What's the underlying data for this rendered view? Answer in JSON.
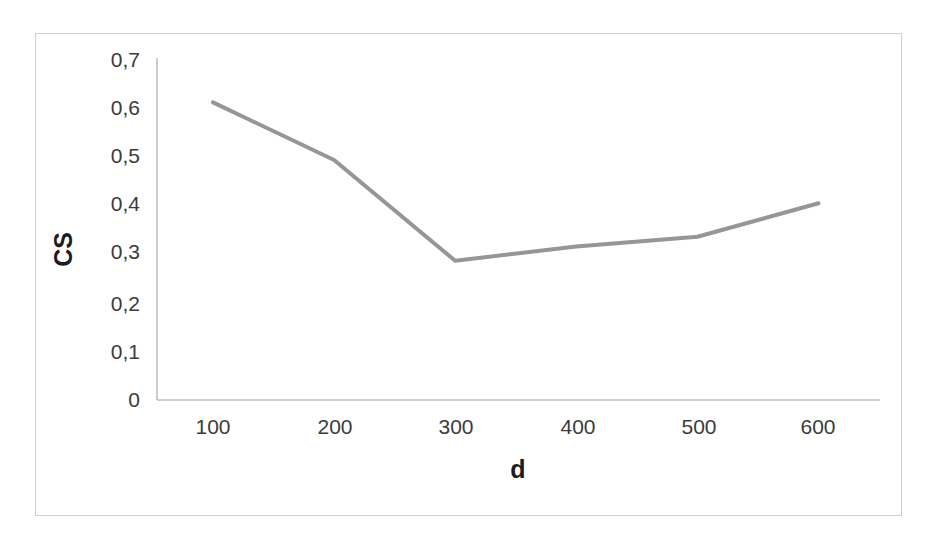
{
  "chart_data": {
    "type": "line",
    "title": "",
    "subtitle": "",
    "xlabel": "d",
    "ylabel": "CS",
    "x": [
      100,
      200,
      300,
      400,
      500,
      600
    ],
    "values": [
      0.62,
      0.5,
      0.29,
      0.32,
      0.34,
      0.41
    ],
    "series": [
      {
        "name": "CS",
        "values": [
          0.62,
          0.5,
          0.29,
          0.32,
          0.34,
          0.41
        ],
        "color": "#969696"
      }
    ],
    "categories": [
      "100",
      "200",
      "300",
      "400",
      "500",
      "600"
    ],
    "x_tick_labels": [
      "100",
      "200",
      "300",
      "400",
      "500",
      "600"
    ],
    "y_tick_labels": [
      "0",
      "0,1",
      "0,2",
      "0,3",
      "0,4",
      "0,5",
      "0,6",
      "0,7"
    ],
    "y_tick_values": [
      0,
      0.1,
      0.2,
      0.3,
      0.4,
      0.5,
      0.6,
      0.7
    ],
    "xlim": [
      50,
      650
    ],
    "ylim": [
      0,
      0.7
    ],
    "grid": false,
    "legend": false,
    "legend_position": "none",
    "decimal_separator": ",",
    "line_color": "#969696",
    "axis_color": "#bfbfbf",
    "frame_color": "#cfcfcf",
    "text_color": "#3b3b3b",
    "title_color": "#1c1c1c",
    "markers": false,
    "line_width": 4
  }
}
